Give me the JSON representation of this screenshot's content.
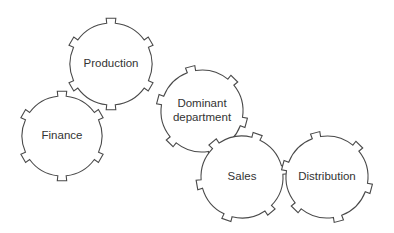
{
  "diagram": {
    "title": "",
    "width": 394,
    "height": 233,
    "style": {
      "stroke": "#4a4a4a",
      "fill": "#ffffff",
      "text": "#333333"
    },
    "gears": [
      {
        "id": "production",
        "label_lines": [
          "Production"
        ],
        "cx": 111,
        "cy": 64,
        "r": 41,
        "teeth": 6,
        "tooth_depth": 5,
        "tooth_width_deg": 12,
        "rotation_deg": 0
      },
      {
        "id": "finance",
        "label_lines": [
          "Finance"
        ],
        "cx": 62,
        "cy": 136,
        "r": 40,
        "teeth": 6,
        "tooth_depth": 5,
        "tooth_width_deg": 12,
        "rotation_deg": 0
      },
      {
        "id": "dominant-department",
        "label_lines": [
          "Dominant",
          "department"
        ],
        "cx": 202,
        "cy": 111,
        "r": 41,
        "teeth": 6,
        "tooth_depth": 5,
        "tooth_width_deg": 12,
        "rotation_deg": -15
      },
      {
        "id": "sales",
        "label_lines": [
          "Sales"
        ],
        "cx": 242,
        "cy": 177,
        "r": 41,
        "teeth": 6,
        "tooth_depth": 5,
        "tooth_width_deg": 12,
        "rotation_deg": 20
      },
      {
        "id": "distribution",
        "label_lines": [
          "Distribution"
        ],
        "cx": 327,
        "cy": 177,
        "r": 41,
        "teeth": 6,
        "tooth_depth": 5,
        "tooth_width_deg": 12,
        "rotation_deg": -15
      }
    ]
  }
}
